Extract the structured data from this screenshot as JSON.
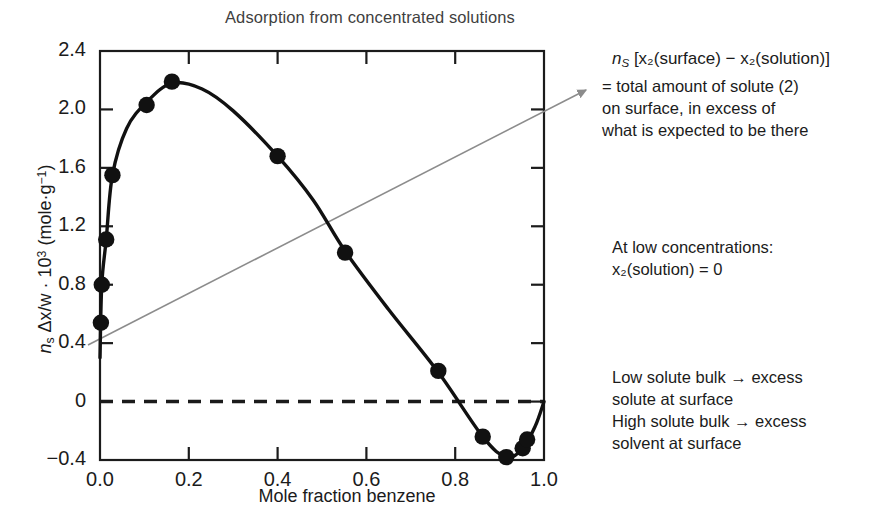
{
  "chart_data": {
    "type": "scatter",
    "title": "Adsorption from concentrated solutions",
    "xlabel": "Mole fraction benzene",
    "ylabel": "n_s Δx/w · 10³ (mole·g⁻¹)",
    "xlim": [
      0.0,
      1.0
    ],
    "ylim": [
      -0.4,
      2.4
    ],
    "xticks": [
      "0.0",
      "0.2",
      "0.4",
      "0.6",
      "0.8",
      "1.0"
    ],
    "xtick_values": [
      0.0,
      0.2,
      0.4,
      0.6,
      0.8,
      1.0
    ],
    "yticks": [
      "2.4",
      "2.0",
      "1.6",
      "1.2",
      "0.8",
      "0.4",
      "0",
      "-0.4"
    ],
    "ytick_values": [
      2.4,
      2.0,
      1.6,
      1.2,
      0.8,
      0.4,
      0,
      -0.4
    ],
    "grid": false,
    "legend": false,
    "zero_line": {
      "y": 0,
      "style": "dashed",
      "label": "zero-reference-line"
    },
    "points": [
      {
        "x": 0.002,
        "y": 0.54
      },
      {
        "x": 0.004,
        "y": 0.8
      },
      {
        "x": 0.014,
        "y": 1.11
      },
      {
        "x": 0.028,
        "y": 1.55
      },
      {
        "x": 0.105,
        "y": 2.03
      },
      {
        "x": 0.162,
        "y": 2.19
      },
      {
        "x": 0.4,
        "y": 1.68
      },
      {
        "x": 0.552,
        "y": 1.02
      },
      {
        "x": 0.762,
        "y": 0.21
      },
      {
        "x": 0.862,
        "y": -0.24
      },
      {
        "x": 0.915,
        "y": -0.38
      },
      {
        "x": 0.952,
        "y": -0.32
      },
      {
        "x": 0.962,
        "y": -0.26
      }
    ],
    "curve": [
      {
        "x": 0.0,
        "y": 0.3
      },
      {
        "x": 0.004,
        "y": 0.8
      },
      {
        "x": 0.014,
        "y": 1.11
      },
      {
        "x": 0.028,
        "y": 1.55
      },
      {
        "x": 0.06,
        "y": 1.87
      },
      {
        "x": 0.105,
        "y": 2.05
      },
      {
        "x": 0.162,
        "y": 2.18
      },
      {
        "x": 0.23,
        "y": 2.14
      },
      {
        "x": 0.3,
        "y": 1.99
      },
      {
        "x": 0.4,
        "y": 1.68
      },
      {
        "x": 0.48,
        "y": 1.38
      },
      {
        "x": 0.552,
        "y": 1.03
      },
      {
        "x": 0.65,
        "y": 0.63
      },
      {
        "x": 0.762,
        "y": 0.2
      },
      {
        "x": 0.862,
        "y": -0.24
      },
      {
        "x": 0.915,
        "y": -0.38
      },
      {
        "x": 0.952,
        "y": -0.32
      },
      {
        "x": 0.98,
        "y": -0.17
      },
      {
        "x": 1.0,
        "y": 0.0
      }
    ],
    "annotation_arrow": {
      "from": [
        88,
        345
      ],
      "to": [
        586,
        90
      ],
      "color": "#8c8c8c",
      "label": "pointer-arrow-to-note"
    },
    "colors": {
      "axis": "#1b1b1b",
      "curve": "#111111",
      "marker": "#111111",
      "arrow": "#8c8c8c",
      "title": "#3f3f3f",
      "zero_line": "#1b1b1b"
    }
  },
  "notes": {
    "formula_prefix": "n",
    "formula_sub": "S",
    "formula_rest": " [x₂(surface) − x₂(solution)]",
    "equals_block": "= total amount of solute (2)\n   on surface, in excess of\n   what is expected to be there",
    "low_conc_line1": "At low concentrations:",
    "low_conc_line2": "x₂(solution) = 0",
    "bulk_block": "Low solute bulk → excess\nsolute at surface\nHigh solute bulk → excess\nsolvent at surface"
  },
  "axis_label_parts": {
    "y_n": "n",
    "y_s": "s",
    "y_mid": " Δx/w · 10",
    "y_exp": "3",
    "y_unit": " (mole·g",
    "y_unit_exp": "−1",
    "y_close": ")"
  }
}
